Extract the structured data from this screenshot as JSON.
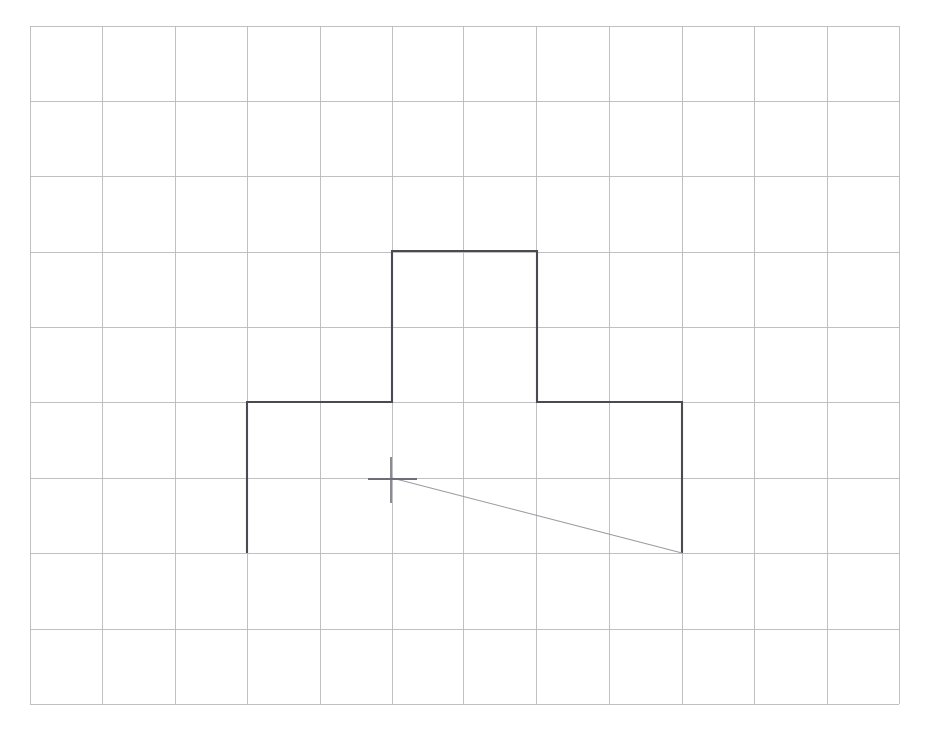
{
  "document": {
    "title": "Graph paper sketch",
    "width": 926,
    "height": 734,
    "background_color": "#ffffff"
  },
  "grid": {
    "name": "graph-paper-grid",
    "line_color": "#b9b9bd",
    "line_width": 0.9,
    "columns": 12,
    "rows": 9,
    "x_lines": [
      30,
      102,
      175,
      247,
      320,
      392,
      463,
      536,
      609,
      682,
      754,
      827,
      899
    ],
    "y_lines": [
      26,
      101,
      176,
      252,
      327,
      402,
      478,
      553,
      629,
      704
    ],
    "cell_width": 72.4,
    "cell_height": 75.3,
    "left": 30,
    "top": 26,
    "right": 899,
    "bottom": 704
  },
  "chart_data": {
    "type": "line",
    "title": "",
    "xlabel": "",
    "ylabel": "",
    "grid": true,
    "legend": "none",
    "xlim": [
      30,
      899
    ],
    "ylim": [
      26,
      704
    ],
    "series": [
      {
        "name": "stepped-outline",
        "style": "polyline",
        "color": "#4a4a52",
        "width": 2.1,
        "closed": false,
        "points": [
          [
            247,
            553
          ],
          [
            247,
            402
          ],
          [
            392,
            402
          ],
          [
            392,
            251
          ],
          [
            537,
            251
          ],
          [
            537,
            402
          ],
          [
            682,
            402
          ],
          [
            682,
            553
          ]
        ]
      },
      {
        "name": "diagonal-chord",
        "style": "line",
        "color": "#9a9aa2",
        "width": 1.1,
        "points": [
          [
            392,
            478
          ],
          [
            682,
            553
          ]
        ]
      }
    ],
    "annotations": [
      {
        "name": "crosshair-marker",
        "kind": "crosshair",
        "color": "#6e6e76",
        "x": 391,
        "y": 479,
        "h_x1": 368,
        "h_x2": 417,
        "v_y1": 457,
        "v_y2": 503
      }
    ]
  }
}
